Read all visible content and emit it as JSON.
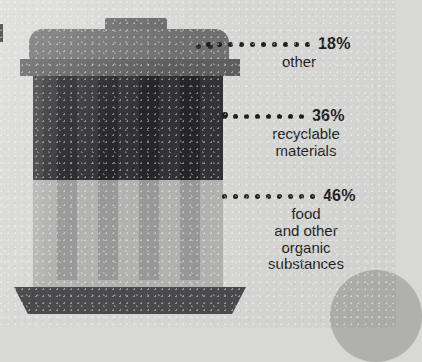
{
  "chart_data": {
    "type": "bar",
    "orientation": "stacked-vertical",
    "categories": [
      "other",
      "recyclable materials",
      "food and other organic substances"
    ],
    "values": [
      18,
      36,
      46
    ],
    "units": "%",
    "illustration": "waste-bin",
    "legend_position": "right-callouts",
    "grid": false,
    "segments": [
      {
        "pct": "18%",
        "label": "other",
        "share": 18,
        "color": "#333335"
      },
      {
        "pct": "36%",
        "label": "recyclable\nmaterials",
        "share": 36,
        "color": "#333335"
      },
      {
        "pct": "46%",
        "label": "food\nand other\norganic\nsubstances",
        "share": 46,
        "color": "#b3b3b1"
      }
    ]
  },
  "callouts": {
    "other": {
      "pct": "18%",
      "label": "other",
      "dots": 10
    },
    "recyclable": {
      "pct": "36%",
      "label": "recyclable\nmaterials",
      "dots": 8
    },
    "organic": {
      "pct": "46%",
      "label": "food\nand other\norganic\nsubstances",
      "dots": 9
    }
  },
  "colors": {
    "background": "#d8d8d6",
    "lid": "#707070",
    "rim": "#5f5f5f",
    "body_dark": "#333335",
    "rib_dark": "#262628",
    "body_light": "#b3b3b1",
    "rib_light": "#99999a",
    "base": "#4b4b4d",
    "text": "#1d1d1d"
  },
  "icons": {
    "bin": "trash-bin-icon",
    "handle": "bin-handle-icon",
    "dot_leader": "dotted-leader-icon"
  }
}
